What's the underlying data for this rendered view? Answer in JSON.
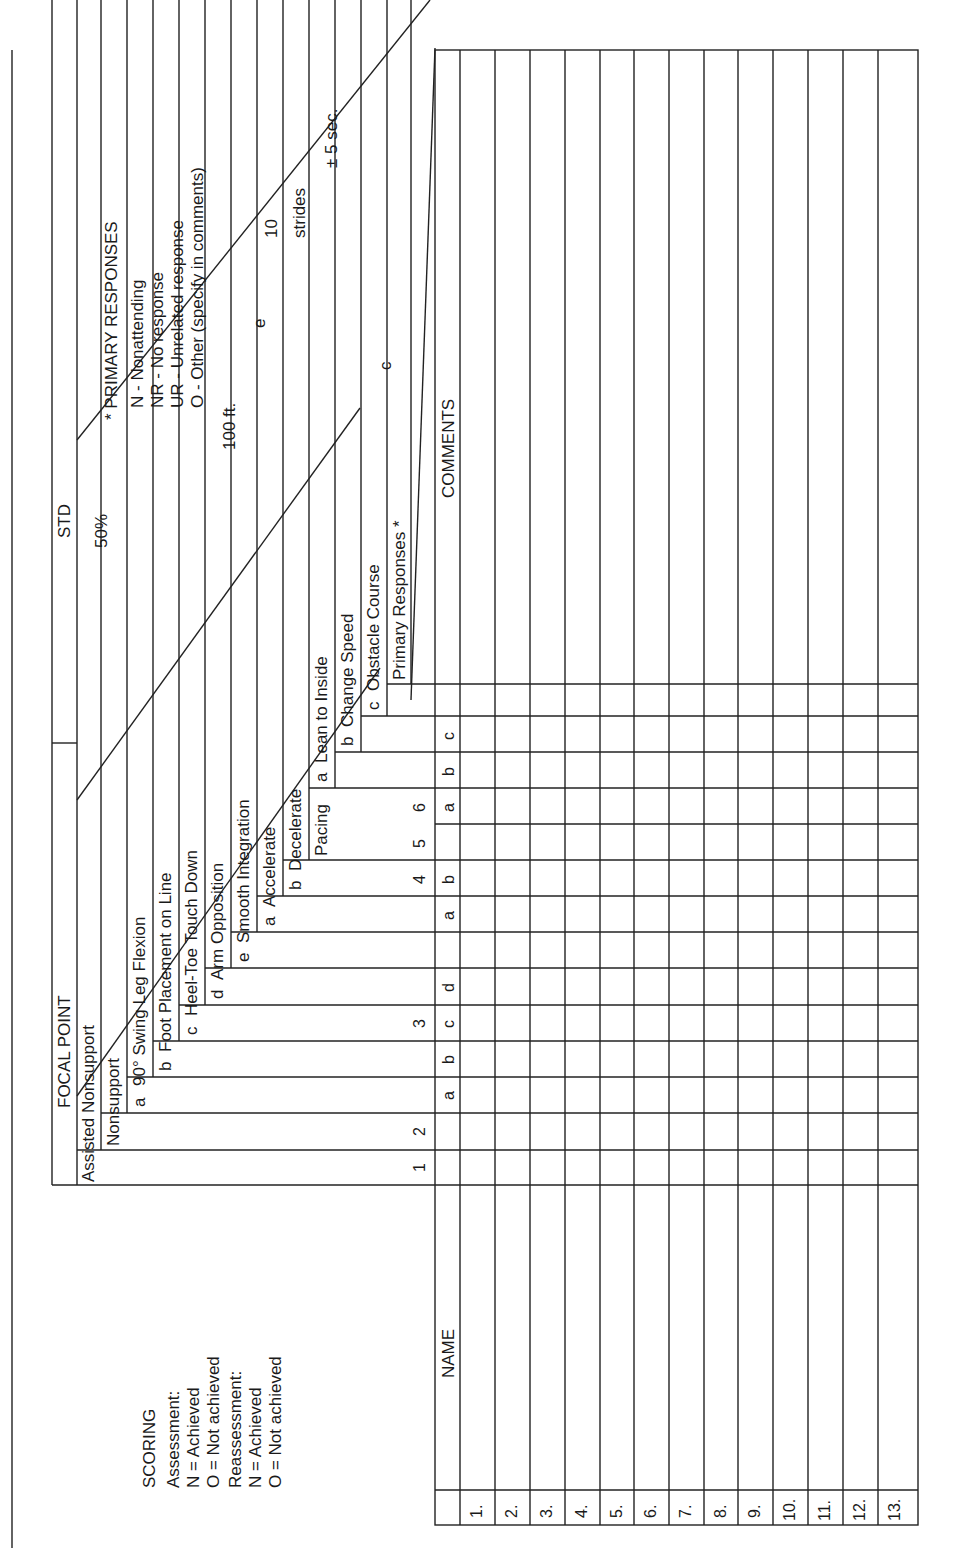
{
  "scoring": {
    "title": "SCORING",
    "assessment_label": "Assessment:",
    "assessment_n": "N = Achieved",
    "assessment_o": "O = Not achieved",
    "reassessment_label": "Reassessment:",
    "reassessment_n": "N = Achieved",
    "reassessment_o": "O = Not achieved"
  },
  "header": {
    "focal_point": "FOCAL POINT",
    "std": "STD"
  },
  "focal_points": {
    "assisted_nonsupport": "Assisted Nonsupport",
    "nonsupport": "Nonsupport",
    "item3": {
      "a_letter": "a",
      "a": "90° Swing Leg Flexion",
      "b_letter": "b",
      "b": "Foot Placement on Line",
      "c_letter": "c",
      "c": "Heel-Toe Touch Down",
      "d_letter": "d",
      "d": "Arm Opposition",
      "e_letter": "e",
      "e": "Smooth Integration"
    },
    "item4": {
      "a_letter": "a",
      "a": "Accelerate",
      "b_letter": "b",
      "b": "Decelerate"
    },
    "item5": {
      "label": "Pacing"
    },
    "item6": {
      "a_letter": "a",
      "a": "Lean to Inside",
      "b_letter": "b",
      "b": "Change Speed",
      "c_letter": "c",
      "c": "Obstacle Course"
    },
    "primary_responses": "Primary Responses *"
  },
  "standards": {
    "fifty_percent": "50%",
    "hundred_ft": "100 ft.",
    "e_letter": "e",
    "ten": "10",
    "strides": "strides",
    "plus_minus_5sec": "± 5 sec.",
    "c_letter": "c"
  },
  "primary_responses_legend": {
    "title": "* PRIMARY RESPONSES",
    "items": [
      "N - Nonattending",
      "NR - No response",
      "UR - Unrelated response",
      "O - Other (specify in comments)"
    ]
  },
  "table": {
    "name_header": "NAME",
    "comments_header": "COMMENTS",
    "column_numbers": [
      "1",
      "2",
      "3",
      "4",
      "5",
      "6"
    ],
    "sub_letters": {
      "c3": [
        "a",
        "b",
        "c",
        "d"
      ],
      "c4": [
        "a",
        "b"
      ],
      "c6": [
        "a",
        "b",
        "c"
      ]
    },
    "rows": [
      "1.",
      "2.",
      "3.",
      "4.",
      "5.",
      "6.",
      "7.",
      "8.",
      "9.",
      "10.",
      "11.",
      "12.",
      "13."
    ]
  }
}
